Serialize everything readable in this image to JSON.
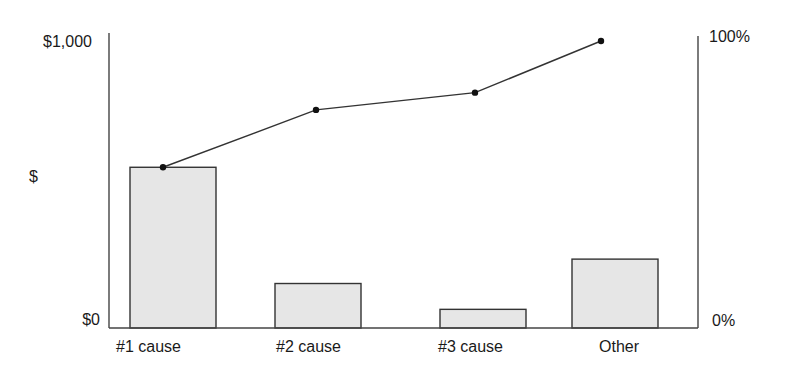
{
  "chart_data": {
    "type": "bar",
    "subtype": "pareto",
    "title": "",
    "categories": [
      "#1 cause",
      "#2 cause",
      "#3 cause",
      "Other"
    ],
    "series": [
      {
        "name": "Cost",
        "type": "bar",
        "axis": "left",
        "values": [
          560,
          155,
          65,
          240
        ]
      },
      {
        "name": "Cumulative %",
        "type": "line",
        "axis": "right",
        "values": [
          56,
          76,
          82,
          100
        ]
      }
    ],
    "xlabel": "",
    "ylabel": "$",
    "ylim": [
      0,
      1000
    ],
    "y2lim": [
      0,
      100
    ],
    "left_axis": {
      "top_label": "$1,000",
      "middle_label": "$",
      "bottom_label": "$0"
    },
    "right_axis": {
      "top_label": "100%",
      "bottom_label": "0%"
    },
    "grid": false,
    "legend": "none",
    "colors": {
      "bar_fill": "#e6e6e6",
      "bar_stroke": "#333333",
      "line": "#333333",
      "marker": "#111111",
      "axis": "#444444"
    }
  }
}
